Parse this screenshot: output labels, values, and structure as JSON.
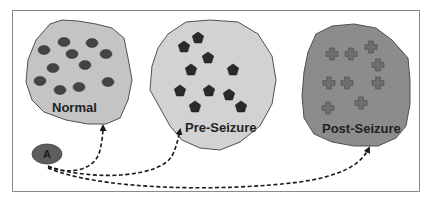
{
  "colors": {
    "frame": "#8a8a8a",
    "normal_fill": "#c4c4c4",
    "pre_fill": "#d2d2d2",
    "post_fill": "#8c8c8c",
    "outline": "#505050",
    "ellipse_marker": "#444444",
    "pentagon_marker": "#2a2a2a",
    "cross_marker": "#6e6e6e",
    "label_text": "#222222",
    "node_fill": "#5e5e5e",
    "arrow": "#1a1a1a"
  },
  "regions": [
    {
      "id": "normal",
      "label": "Normal",
      "marker_shape": "ellipse",
      "marker_count": 11
    },
    {
      "id": "pre-seizure",
      "label": "Pre-Seizure",
      "marker_shape": "pentagon",
      "marker_count": 10
    },
    {
      "id": "post-seizure",
      "label": "Post-Seizure",
      "marker_shape": "cross",
      "marker_count": 9
    }
  ],
  "source_node": {
    "label": "A"
  },
  "arrows": [
    {
      "from": "A",
      "to": "Normal"
    },
    {
      "from": "A",
      "to": "Pre-Seizure"
    },
    {
      "from": "A",
      "to": "Post-Seizure"
    }
  ]
}
